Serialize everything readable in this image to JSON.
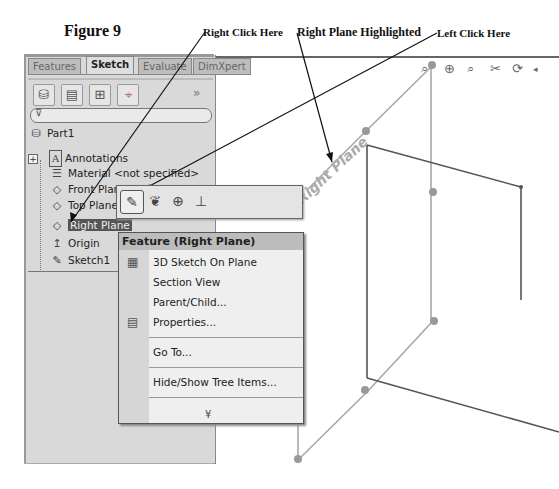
{
  "figure": {
    "title": "Figure 9",
    "callouts": {
      "right_click": "Right Click Here",
      "highlighted": "Right Plane Highlighted",
      "left_click": "Left Click Here"
    }
  },
  "feature_manager": {
    "tabs": [
      {
        "label": "Features",
        "active": false
      },
      {
        "label": "Sketch",
        "active": true
      },
      {
        "label": "Evaluate",
        "active": false
      },
      {
        "label": "DimXpert",
        "active": false
      }
    ],
    "manager_buttons": [
      "feature-tree-icon",
      "property-manager-icon",
      "configuration-manager-icon",
      "dimxpert-manager-icon"
    ],
    "overflow_glyph": "»",
    "filter_glyph": "⊽",
    "tree": {
      "root": "Part1",
      "items": [
        {
          "label": "Annotations",
          "icon": "annotations-icon",
          "glyph": "A"
        },
        {
          "label": "Material <not specified>",
          "icon": "material-icon",
          "glyph": "☰"
        },
        {
          "label": "Front Plane",
          "icon": "plane-icon",
          "glyph": "◇"
        },
        {
          "label": "Top Plane",
          "icon": "plane-icon",
          "glyph": "◇"
        },
        {
          "label": "Right Plane",
          "icon": "plane-icon",
          "glyph": "◇",
          "selected": true
        },
        {
          "label": "Origin",
          "icon": "origin-icon",
          "glyph": "↥"
        },
        {
          "label": "Sketch1",
          "icon": "sketch-icon",
          "glyph": "✎"
        }
      ],
      "expand_glyph": "+"
    }
  },
  "context_toolbar": {
    "tools": [
      {
        "name": "sketch",
        "glyph": "✎"
      },
      {
        "name": "view-sketch-relations",
        "glyph": "❦"
      },
      {
        "name": "zoom-to-selection",
        "glyph": "⊕"
      },
      {
        "name": "normal-to",
        "glyph": "⊥"
      }
    ]
  },
  "context_menu": {
    "header": "Feature (Right Plane)",
    "items": [
      {
        "label": "3D Sketch On Plane",
        "icon": "3d-sketch-icon",
        "glyph": "▦"
      },
      {
        "label": "Section View"
      },
      {
        "label": "Parent/Child..."
      },
      {
        "label": "Properties...",
        "icon": "properties-icon",
        "glyph": "▤"
      },
      {
        "label": "Go To..."
      },
      {
        "label": "Hide/Show Tree Items..."
      }
    ],
    "more_glyph": "¥"
  },
  "graphics_area": {
    "plane_label": "Right Plane",
    "view_toolbar": [
      "zoom-to-fit",
      "zoom-to-area",
      "previous-view",
      "section-view",
      "rotate-view"
    ]
  }
}
